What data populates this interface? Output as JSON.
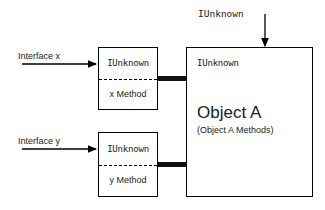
{
  "diagram": {
    "colors": {
      "stroke": "#000000",
      "connector": "#111111",
      "background": "#ffffff"
    },
    "top_arrow": {
      "label": "IUnknown",
      "direction": "down",
      "target": "object-a-box"
    },
    "interfaces": [
      {
        "id": "interface-x",
        "arrow_label": "Interface x",
        "top_cell": "IUnknown",
        "bottom_cell": "x Method"
      },
      {
        "id": "interface-y",
        "arrow_label": "Interface y",
        "top_cell": "IUnknown",
        "bottom_cell": "y Method"
      }
    ],
    "object": {
      "iunknown_label": "IUnknown",
      "title": "Object A",
      "subtitle": "(Object A Methods)"
    }
  }
}
